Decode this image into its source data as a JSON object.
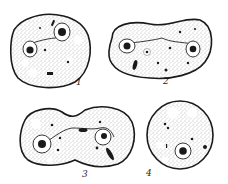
{
  "figure": {
    "background": "#ffffff",
    "ink_color": "#1a1a1a",
    "stipple_color": "#6a6a6a",
    "panels": [
      {
        "id": "1",
        "label": "1",
        "description": "Round cell with two nuclei in vacuoles, connected by a line",
        "label_pos": [
          78,
          85
        ]
      },
      {
        "id": "2",
        "label": "2",
        "description": "Elongated kidney-shaped cell with two nuclei at opposite ends",
        "label_pos": [
          166,
          84
        ]
      },
      {
        "id": "3",
        "label": "3",
        "description": "Dividing dumbbell-shaped cell with two nuclei",
        "label_pos": [
          84,
          178
        ]
      },
      {
        "id": "4",
        "label": "4",
        "description": "Round cell with single central nucleus and vacuoles",
        "label_pos": [
          148,
          176
        ]
      }
    ]
  }
}
